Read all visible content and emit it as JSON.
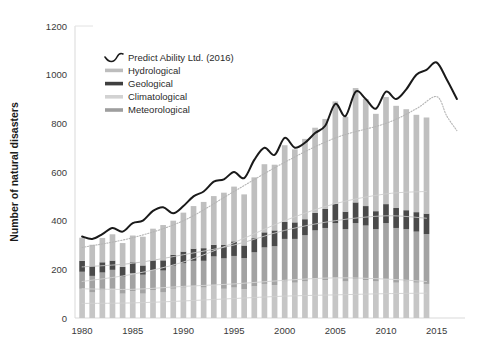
{
  "chart_data": {
    "type": "bar",
    "title": "",
    "subtitle": "",
    "xlabel": "",
    "ylabel": "Number of natural disasters",
    "xlim": [
      1979.3,
      2017.8
    ],
    "ylim": [
      0,
      1200
    ],
    "ytick_labels": [
      "0",
      "200",
      "400",
      "600",
      "800",
      "1000",
      "1200"
    ],
    "yticks": [
      0,
      200,
      400,
      600,
      800,
      1000,
      1200
    ],
    "xtick_labels": [
      "1980",
      "1985",
      "1990",
      "1995",
      "2000",
      "2005",
      "2010",
      "2015"
    ],
    "xticks": [
      1980,
      1985,
      1990,
      1995,
      2000,
      2005,
      2010,
      2015
    ],
    "grid": false,
    "legend_position": "top-left-inside",
    "stacked": true,
    "bar_order_bottom_to_top": [
      "Climatological",
      "Meteorological",
      "Geological",
      "Hydrological"
    ],
    "categories": [
      1980,
      1981,
      1982,
      1983,
      1984,
      1985,
      1986,
      1987,
      1988,
      1989,
      1990,
      1991,
      1992,
      1993,
      1994,
      1995,
      1996,
      1997,
      1998,
      1999,
      2000,
      2001,
      2002,
      2003,
      2004,
      2005,
      2006,
      2007,
      2008,
      2009,
      2010,
      2011,
      2012,
      2013,
      2014
    ],
    "series": [
      {
        "name": "Climatological",
        "color": "#c6c6c6",
        "values": [
          120,
          105,
          115,
          120,
          100,
          110,
          100,
          115,
          105,
          120,
          125,
          130,
          125,
          135,
          120,
          125,
          118,
          130,
          140,
          135,
          150,
          145,
          150,
          160,
          155,
          165,
          150,
          160,
          155,
          150,
          160,
          145,
          150,
          145,
          140
        ]
      },
      {
        "name": "Meteorological",
        "color": "#a3a3a3",
        "values": [
          70,
          68,
          72,
          78,
          70,
          75,
          78,
          82,
          90,
          95,
          100,
          105,
          110,
          118,
          125,
          130,
          128,
          140,
          150,
          160,
          175,
          180,
          190,
          200,
          215,
          225,
          215,
          230,
          225,
          215,
          230,
          225,
          215,
          210,
          205
        ]
      },
      {
        "name": "Geological",
        "color": "#4a4a4a",
        "values": [
          45,
          40,
          42,
          38,
          40,
          44,
          38,
          40,
          42,
          45,
          48,
          50,
          52,
          48,
          55,
          60,
          52,
          58,
          62,
          65,
          70,
          68,
          66,
          72,
          78,
          80,
          72,
          85,
          80,
          74,
          78,
          82,
          78,
          80,
          84
        ]
      },
      {
        "name": "Hydrological",
        "color": "#bfbfbf",
        "values": [
          95,
          88,
          100,
          108,
          98,
          110,
          118,
          130,
          145,
          140,
          160,
          175,
          190,
          200,
          215,
          225,
          210,
          250,
          280,
          270,
          315,
          300,
          330,
          350,
          370,
          420,
          390,
          470,
          440,
          400,
          440,
          420,
          415,
          400,
          395
        ]
      }
    ],
    "trend_lines": [
      {
        "name": "Predict Ability Ltd. (2016)",
        "style": "solid-thick",
        "color": "#1a1a1a",
        "x": [
          1980,
          1981,
          1982,
          1983,
          1984,
          1985,
          1986,
          1987,
          1988,
          1989,
          1990,
          1991,
          1992,
          1993,
          1994,
          1995,
          1996,
          1997,
          1998,
          1999,
          2000,
          2001,
          2002,
          2003,
          2004,
          2005,
          2006,
          2007,
          2008,
          2009,
          2010,
          2011,
          2012,
          2013,
          2014,
          2015,
          2016,
          2017
        ],
        "y": [
          335,
          325,
          345,
          370,
          355,
          390,
          400,
          440,
          455,
          430,
          460,
          500,
          520,
          560,
          570,
          600,
          575,
          650,
          700,
          670,
          740,
          700,
          720,
          760,
          790,
          880,
          830,
          930,
          900,
          860,
          930,
          900,
          940,
          1000,
          1020,
          1050,
          980,
          900
        ]
      },
      {
        "name": "total-dotted",
        "style": "dotted",
        "color": "#b5b5b5",
        "x": [
          1980,
          1985,
          1990,
          1995,
          2000,
          2005,
          2010,
          2013,
          2015,
          2016,
          2017
        ],
        "y": [
          290,
          330,
          400,
          520,
          640,
          740,
          800,
          860,
          910,
          830,
          770
        ]
      },
      {
        "name": "hydrological-trend",
        "style": "thin",
        "color": "#cfcfcf",
        "x": [
          1980,
          1985,
          1990,
          1995,
          2000,
          2005,
          2010,
          2014
        ],
        "y": [
          150,
          180,
          230,
          310,
          400,
          470,
          510,
          520
        ]
      },
      {
        "name": "meteorological-trend",
        "style": "thin",
        "color": "#c2c2c2",
        "x": [
          1980,
          1985,
          1990,
          1995,
          2000,
          2005,
          2010,
          2014
        ],
        "y": [
          210,
          225,
          260,
          300,
          360,
          400,
          420,
          410
        ]
      },
      {
        "name": "climatological-trend",
        "style": "thin",
        "color": "#d5d5d5",
        "x": [
          1980,
          1985,
          1990,
          1995,
          2000,
          2005,
          2010,
          2014
        ],
        "y": [
          120,
          118,
          130,
          140,
          155,
          165,
          160,
          150
        ]
      },
      {
        "name": "geological-trend",
        "style": "thin",
        "color": "#d0d0d0",
        "x": [
          1980,
          1985,
          1990,
          1995,
          2000,
          2005,
          2010,
          2014
        ],
        "y": [
          60,
          62,
          70,
          80,
          90,
          95,
          100,
          102
        ]
      }
    ]
  },
  "legend": {
    "items": [
      {
        "label": "Predict Ability Ltd. (2016)",
        "marker": "curve",
        "color": "#1a1a1a"
      },
      {
        "label": "Hydrological",
        "marker": "bar",
        "color": "#bdbdbd"
      },
      {
        "label": "Geological",
        "marker": "bar",
        "color": "#3f3f3f"
      },
      {
        "label": "Climatological",
        "marker": "bar",
        "color": "#d2d2d2"
      },
      {
        "label": "Meteorological",
        "marker": "bar",
        "color": "#9e9e9e"
      }
    ]
  },
  "axes": {
    "y_title": "Number of natural disasters",
    "axis_color": "#d9d9d9"
  }
}
